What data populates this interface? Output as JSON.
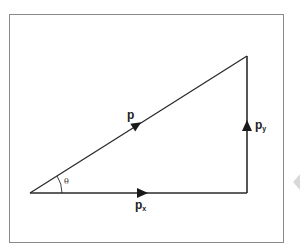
{
  "diagram": {
    "type": "vector-decomposition",
    "labels": {
      "p": "p",
      "px_base": "p",
      "px_sub": "x",
      "py_base": "p",
      "py_sub": "y",
      "theta": "θ"
    },
    "vertices": {
      "origin": [
        30,
        193
      ],
      "corner": [
        247,
        193
      ],
      "apex": [
        247,
        56
      ]
    },
    "vectors": [
      {
        "name": "p",
        "from": "origin",
        "to": "apex",
        "role": "resultant"
      },
      {
        "name": "px",
        "from": "origin",
        "to": "corner",
        "role": "horizontal component"
      },
      {
        "name": "py",
        "from": "corner",
        "to": "apex",
        "role": "vertical component"
      }
    ],
    "angle": {
      "name": "θ",
      "at": "origin",
      "between": [
        "p",
        "px"
      ]
    },
    "colors": {
      "line": "#2a2a2a",
      "frame": "#8a8a8a",
      "background": "#ffffff"
    }
  }
}
